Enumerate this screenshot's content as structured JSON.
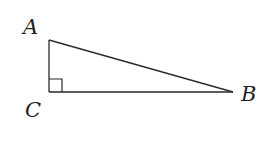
{
  "diagram": {
    "type": "right-triangle",
    "stroke_color": "#2a2a2a",
    "vertices": {
      "A": {
        "label": "A",
        "x": 49,
        "y": 40
      },
      "B": {
        "label": "B",
        "x": 233,
        "y": 92
      },
      "C": {
        "label": "C",
        "x": 49,
        "y": 92
      }
    },
    "right_angle_at": "C",
    "edges": [
      {
        "from": "A",
        "to": "C"
      },
      {
        "from": "C",
        "to": "B"
      },
      {
        "from": "A",
        "to": "B"
      }
    ]
  }
}
